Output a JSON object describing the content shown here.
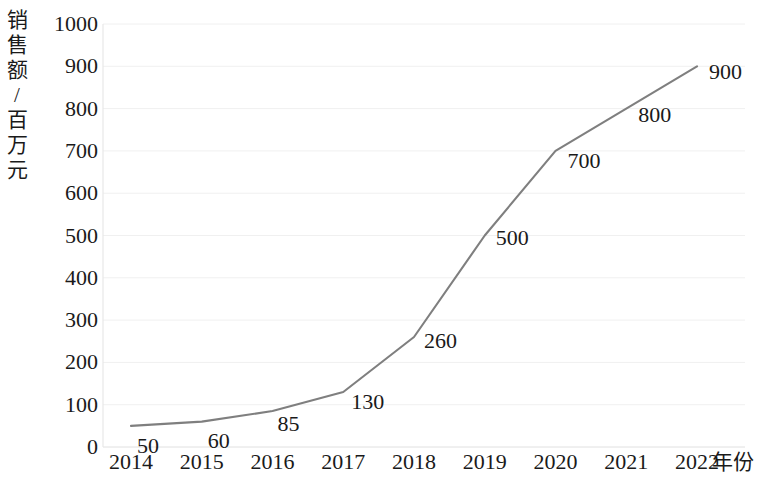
{
  "chart_data": {
    "type": "line",
    "title": "",
    "xlabel": "年份",
    "ylabel": "销售额/百万元",
    "ylabel_chars": "销\n售\n额\n/\n百\n万\n元",
    "categories": [
      "2014",
      "2015",
      "2016",
      "2017",
      "2018",
      "2019",
      "2020",
      "2021",
      "2022"
    ],
    "x": [
      2014,
      2015,
      2016,
      2017,
      2018,
      2019,
      2020,
      2021,
      2022
    ],
    "values": [
      50,
      60,
      85,
      130,
      260,
      500,
      700,
      800,
      900
    ],
    "point_labels": [
      "50",
      "60",
      "85",
      "130",
      "260",
      "500",
      "700",
      "800",
      "900"
    ],
    "yticks": [
      0,
      100,
      200,
      300,
      400,
      500,
      600,
      700,
      800,
      900,
      1000
    ],
    "ytick_labels": [
      "0",
      "100",
      "200",
      "300",
      "400",
      "500",
      "600",
      "700",
      "800",
      "900",
      "1000"
    ],
    "ylim": [
      0,
      1000
    ],
    "grid": true,
    "grid_axis": "y",
    "legend": false,
    "line_color": "#7f7f7f",
    "grid_color": "#f0f0f0",
    "axis_color": "#e8e8e8",
    "text_color": "#1a1a1a",
    "markers": false
  }
}
